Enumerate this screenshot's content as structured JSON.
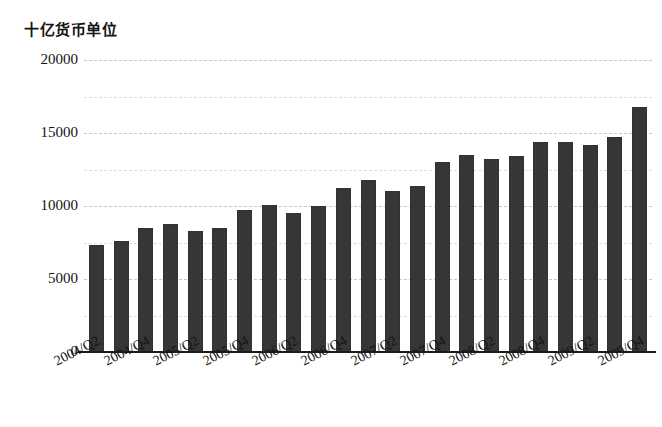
{
  "chart_data": {
    "type": "bar",
    "title": "十亿货币单位",
    "xlabel": "",
    "ylabel": "十亿货币单位",
    "ylim": [
      0,
      20000
    ],
    "ytick_labels": [
      "0",
      "5000",
      "10000",
      "15000",
      "20000"
    ],
    "ytick_values": [
      0,
      5000,
      10000,
      15000,
      20000
    ],
    "minor_gridlines": [
      2500,
      7500,
      12500,
      17500
    ],
    "grid": true,
    "legend": "none",
    "bar_color": "#363636",
    "categories": [
      "2004/Q2",
      "2004/Q3",
      "2004/Q4",
      "2005/Q1",
      "2005/Q2",
      "2005/Q3",
      "2005/Q4",
      "2006/Q1",
      "2006/Q2",
      "2006/Q3",
      "2006/Q4",
      "2007/Q1",
      "2007/Q2",
      "2007/Q3",
      "2007/Q4",
      "2008/Q1",
      "2008/Q2",
      "2008/Q3",
      "2008/Q4",
      "2009/Q1",
      "2009/Q2",
      "2009/Q3",
      "2009/Q4"
    ],
    "tick_labels_shown": [
      "2004/Q2",
      "2004/Q4",
      "2005/Q2",
      "2005/Q4",
      "2006/Q2",
      "2006/Q4",
      "2007/Q2",
      "2007/Q4",
      "2008/Q2",
      "2008/Q4",
      "2009/Q2",
      "2009/Q4"
    ],
    "values": [
      7300,
      7600,
      8500,
      8800,
      8300,
      8500,
      9700,
      10100,
      9500,
      10000,
      11200,
      11800,
      11000,
      11400,
      13000,
      13500,
      13200,
      13400,
      14400,
      14400,
      14200,
      14700,
      16800
    ]
  }
}
